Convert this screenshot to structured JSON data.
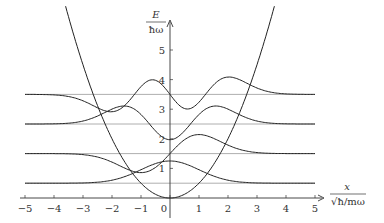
{
  "axes": {
    "y_label_num": "E",
    "y_label_den": "ħω",
    "x_label_num": "x",
    "x_label_den": "√ħ/mω",
    "x_ticks": [
      "−5",
      "−4",
      "−3",
      "−2",
      "−1",
      "0",
      "1",
      "2",
      "3",
      "4",
      "5"
    ],
    "y_ticks": [
      "1",
      "2",
      "3",
      "4",
      "5"
    ]
  },
  "chart_data": {
    "type": "line",
    "title": "",
    "xlabel": "x / √(ħ/mω)",
    "ylabel": "E / ħω",
    "xlim": [
      -5,
      5
    ],
    "ylim": [
      0,
      5.5
    ],
    "grid": false,
    "x_ticks": [
      -5,
      -4,
      -3,
      -2,
      -1,
      0,
      1,
      2,
      3,
      4,
      5
    ],
    "y_ticks": [
      1,
      2,
      3,
      4,
      5
    ],
    "series": [
      {
        "name": "potential V(x)=x²/2",
        "type": "curve"
      },
      {
        "name": "level n=0",
        "energy": 0.5
      },
      {
        "name": "level n=1",
        "energy": 1.5
      },
      {
        "name": "level n=2",
        "energy": 2.5
      },
      {
        "name": "level n=3",
        "energy": 3.5
      },
      {
        "name": "ψ0 offset at E=0.5",
        "energy": 0.5
      },
      {
        "name": "ψ1 offset at E=1.5",
        "energy": 1.5
      },
      {
        "name": "ψ2 offset at E=2.5",
        "energy": 2.5
      },
      {
        "name": "ψ3 offset at E=3.5",
        "energy": 3.5
      }
    ]
  }
}
